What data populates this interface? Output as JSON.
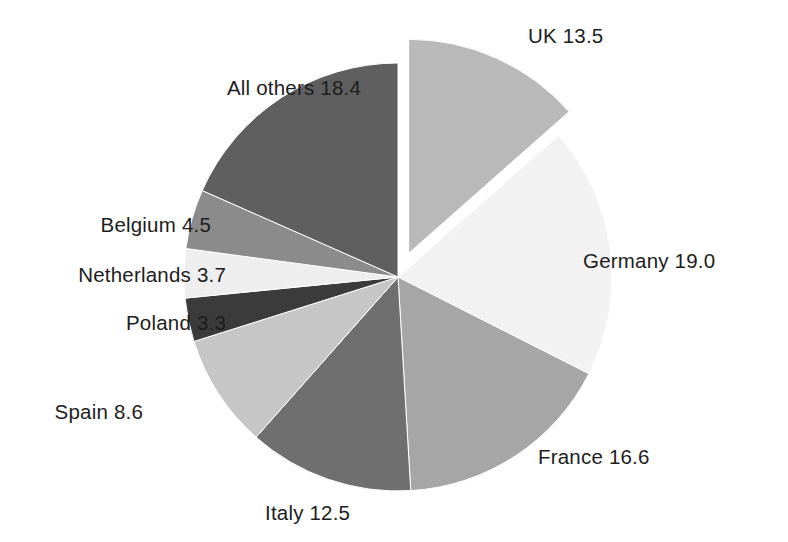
{
  "chart_data": {
    "type": "pie",
    "title": "",
    "subtitle": "",
    "xlabel": "",
    "ylabel": "",
    "legend_position": "none",
    "grid": false,
    "units": "percent",
    "total": 100.1,
    "labels": [
      "UK",
      "Germany",
      "France",
      "Italy",
      "Spain",
      "Poland",
      "Netherlands",
      "Belgium",
      "All others"
    ],
    "values": [
      13.5,
      19.0,
      16.6,
      12.5,
      8.6,
      3.3,
      3.7,
      4.5,
      18.4
    ],
    "data_labels": [
      "UK 13.5",
      "Germany 19.0",
      "France 16.6",
      "Italy 12.5",
      "Spain 8.6",
      "Poland 3.3",
      "Netherlands 3.7",
      "Belgium 4.5",
      "All others 18.4"
    ],
    "colors": [
      "#b9b9b9",
      "#f2f2f2",
      "#a6a6a6",
      "#6f6f6f",
      "#c6c6c6",
      "#3b3b3b",
      "#eeeeee",
      "#8b8b8b",
      "#5f5f5f"
    ],
    "exploded": [
      "UK"
    ],
    "start_angle_deg": 0,
    "direction": "clockwise",
    "slices": [
      {
        "name": "UK",
        "value": 13.5,
        "label": "UK 13.5",
        "color": "#b9b9b9",
        "exploded": true
      },
      {
        "name": "Germany",
        "value": 19.0,
        "label": "Germany 19.0",
        "color": "#f2f2f2",
        "exploded": false
      },
      {
        "name": "France",
        "value": 16.6,
        "label": "France 16.6",
        "color": "#a6a6a6",
        "exploded": false
      },
      {
        "name": "Italy",
        "value": 12.5,
        "label": "Italy 12.5",
        "color": "#6f6f6f",
        "exploded": false
      },
      {
        "name": "Spain",
        "value": 8.6,
        "label": "Spain 8.6",
        "color": "#c6c6c6",
        "exploded": false
      },
      {
        "name": "Poland",
        "value": 3.3,
        "label": "Poland 3.3",
        "color": "#3b3b3b",
        "exploded": false
      },
      {
        "name": "Netherlands",
        "value": 3.7,
        "label": "Netherlands 3.7",
        "color": "#eeeeee",
        "exploded": false
      },
      {
        "name": "Belgium",
        "value": 4.5,
        "label": "Belgium 4.5",
        "color": "#8b8b8b",
        "exploded": false
      },
      {
        "name": "All others",
        "value": 18.4,
        "label": "All others 18.4",
        "color": "#5f5f5f",
        "exploded": false
      }
    ]
  },
  "labels": {
    "uk": "UK 13.5",
    "germany": "Germany 19.0",
    "france": "France 16.6",
    "italy": "Italy 12.5",
    "spain": "Spain 8.6",
    "poland": "Poland 3.3",
    "netherlands": "Netherlands 3.7",
    "belgium": "Belgium 4.5",
    "all_others": "All others 18.4"
  },
  "colors": {
    "background": "#ffffff",
    "text": "#1d1d1d"
  }
}
